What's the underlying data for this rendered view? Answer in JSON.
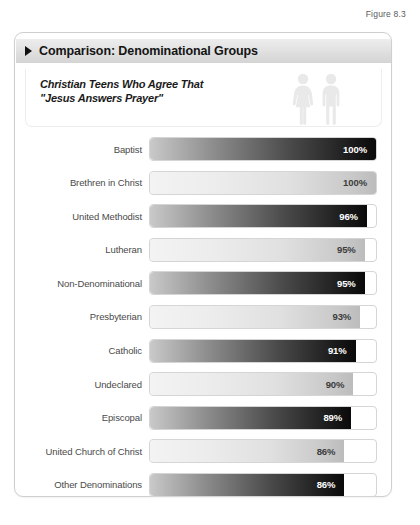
{
  "figure_label": "Figure 8.3",
  "card": {
    "header_title": "Comparison: Denominational Groups",
    "header_marker_icon": "triangle-right-icon",
    "subtitle": "Christian Teens Who Agree That\n\"Jesus Answers Prayer\"",
    "people_icon_female": "person-female-icon",
    "people_icon_male": "person-male-icon"
  },
  "colors": {
    "bar_dark_start": "#c9c9c9",
    "bar_dark_end": "#0a0a0a",
    "bar_light_start": "#f3f3f3",
    "bar_light_end": "#bcbcbc",
    "track_border": "#d5d5d5",
    "card_border": "#cfcfcf",
    "header_band": "#e2e2e2",
    "label_text": "#4a4a4a"
  },
  "chart_data": {
    "type": "bar",
    "title": "Comparison: Denominational Groups",
    "subtitle": "Christian Teens Who Agree That \"Jesus Answers Prayer\"",
    "orientation": "horizontal",
    "xlabel": "",
    "ylabel": "",
    "xlim": [
      0,
      100
    ],
    "unit": "%",
    "grid": false,
    "legend": "none",
    "categories": [
      "Baptist",
      "Brethren in Christ",
      "United Methodist",
      "Lutheran",
      "Non-Denominational",
      "Presbyterian",
      "Catholic",
      "Undeclared",
      "Episcopal",
      "United Church of Christ",
      "Other Denominations"
    ],
    "values": [
      100,
      100,
      96,
      95,
      95,
      93,
      91,
      90,
      89,
      86,
      86
    ],
    "value_labels": [
      "100%",
      "100%",
      "96%",
      "95%",
      "95%",
      "93%",
      "91%",
      "90%",
      "89%",
      "86%",
      "86%"
    ],
    "bar_styles": [
      "dark",
      "light",
      "dark",
      "light",
      "dark",
      "light",
      "dark",
      "light",
      "dark",
      "light",
      "dark"
    ]
  }
}
